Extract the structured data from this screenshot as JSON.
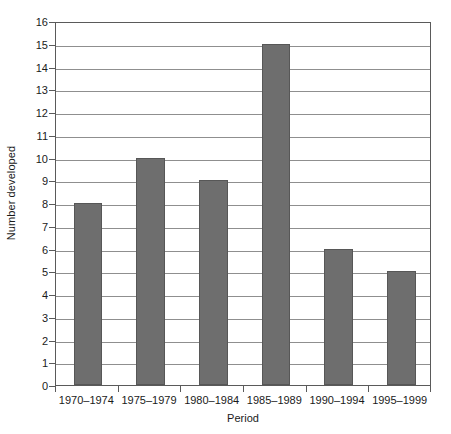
{
  "chart_data": {
    "type": "bar",
    "title": "",
    "categories": [
      "1970–1974",
      "1975–1979",
      "1980–1984",
      "1985–1989",
      "1990–1994",
      "1995–1999"
    ],
    "values": [
      8,
      10,
      9,
      15,
      6,
      5
    ],
    "xlabel": "Period",
    "ylabel": "Number developed",
    "ylim": [
      0,
      16
    ],
    "ytick_step": 1,
    "yticks": [
      0,
      1,
      2,
      3,
      4,
      5,
      6,
      7,
      8,
      9,
      10,
      11,
      12,
      13,
      14,
      15,
      16
    ],
    "ytick_labels": [
      "0",
      "1",
      "2",
      "3",
      "4",
      "5",
      "6",
      "7",
      "8",
      "9",
      "10",
      "11",
      "12",
      "13",
      "14",
      "15",
      "16"
    ],
    "grid": true,
    "grid_axis": "y",
    "legend": false,
    "legend_position": "none",
    "bar_color": "#6e6e6e",
    "bar_border_color": "#575757",
    "grid_color": "#8f8f8f",
    "frame_color": "#5a5a5a",
    "background_color": "#ffffff",
    "text_color": "#1a1a1a"
  }
}
